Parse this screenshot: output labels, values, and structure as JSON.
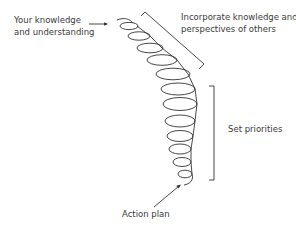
{
  "labels": {
    "your_knowledge_line1": "Your knowledge",
    "your_knowledge_line2": "and understanding",
    "incorporate_line1": "Incorporate knowledge and",
    "incorporate_line2": "perspectives of others",
    "set_priorities": "Set priorities",
    "action_plan": "Action plan"
  },
  "colors": {
    "stroke": "#333333",
    "text": "#3a3a3a",
    "background": "#ffffff"
  }
}
